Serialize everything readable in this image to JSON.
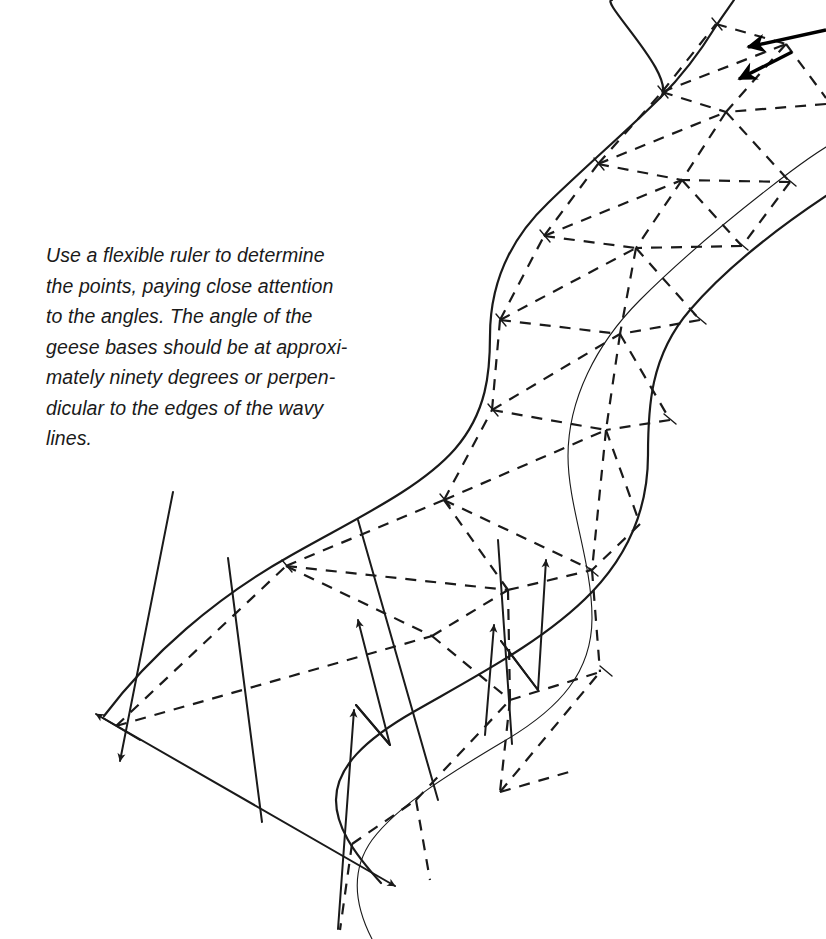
{
  "page": {
    "background_color": "#ffffff",
    "ink_color": "#1a1a1a",
    "width": 826,
    "height": 939
  },
  "caption": {
    "full_text": "Use a flexible ruler to determine the points, paying close attention to the angles. The angle of the geese bases should be at approximately ninety degrees or perpendicular to the edges of the wavy lines.",
    "lines": [
      "Use a flexible ruler to determine",
      "the points, paying close attention",
      "to the angles. The angle of the",
      "geese bases should be at approxi-",
      "mately ninety degrees or perpen-",
      "dicular to the edges of the wavy",
      "lines."
    ]
  },
  "diagram": {
    "type": "quilting-pattern-construction",
    "elements": {
      "outer_edge_left_label": "wavy line left edge",
      "outer_edge_right_label": "wavy line right edge",
      "center_line_label": "center guide line",
      "dashed_label": "flying geese seam lines",
      "arrow_label": "perpendicular angle indicator"
    },
    "stroke_widths": {
      "outer_edge": 2.2,
      "center_line": 1.1,
      "dashed": 2.2,
      "arrow": 2.0,
      "thick_arrow": 3.4
    },
    "dash_pattern": "11 9"
  }
}
